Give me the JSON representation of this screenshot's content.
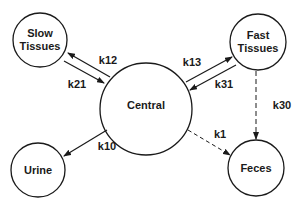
{
  "diagram": {
    "type": "compartment-model",
    "nodes": [
      {
        "id": "slow",
        "label_lines": [
          "Slow",
          "Tissues"
        ],
        "cx": 40,
        "cy": 40,
        "r": 27
      },
      {
        "id": "fast",
        "label_lines": [
          "Fast",
          "Tissues"
        ],
        "cx": 258,
        "cy": 42,
        "r": 28
      },
      {
        "id": "central",
        "label_lines": [
          "Central"
        ],
        "cx": 146,
        "cy": 109,
        "r": 46
      },
      {
        "id": "urine",
        "label_lines": [
          "Urine"
        ],
        "cx": 38,
        "cy": 170,
        "r": 27
      },
      {
        "id": "feces",
        "label_lines": [
          "Feces"
        ],
        "cx": 256,
        "cy": 168,
        "r": 28
      }
    ],
    "edges": [
      {
        "id": "k12",
        "label": "k12",
        "from": "central",
        "to": "slow",
        "style": "solid"
      },
      {
        "id": "k21",
        "label": "k21",
        "from": "slow",
        "to": "central",
        "style": "solid"
      },
      {
        "id": "k13",
        "label": "k13",
        "from": "central",
        "to": "fast",
        "style": "solid"
      },
      {
        "id": "k31",
        "label": "k31",
        "from": "fast",
        "to": "central",
        "style": "solid"
      },
      {
        "id": "k10",
        "label": "k10",
        "from": "central",
        "to": "urine",
        "style": "solid"
      },
      {
        "id": "k1",
        "label": "k1",
        "from": "central",
        "to": "feces",
        "style": "dashed"
      },
      {
        "id": "k30",
        "label": "k30",
        "from": "fast",
        "to": "feces",
        "style": "dashed"
      }
    ]
  },
  "labels": {
    "slow_line1": "Slow",
    "slow_line2": "Tissues",
    "fast_line1": "Fast",
    "fast_line2": "Tissues",
    "central": "Central",
    "urine": "Urine",
    "feces": "Feces",
    "k12": "k12",
    "k21": "k21",
    "k13": "k13",
    "k31": "k31",
    "k10": "k10",
    "k1": "k1",
    "k30": "k30"
  },
  "colors": {
    "stroke": "#1a1a1a",
    "background": "#ffffff"
  }
}
